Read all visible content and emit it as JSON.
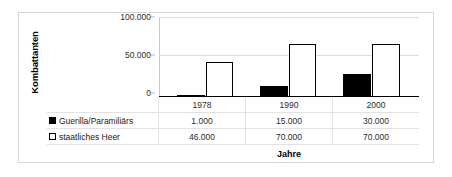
{
  "chart_data": {
    "type": "bar",
    "title": "",
    "xlabel": "Jahre",
    "ylabel": "Kombattanten",
    "categories": [
      "1978",
      "1990",
      "2000"
    ],
    "series": [
      {
        "name": "Guerilla/Paramiliärs",
        "marker": "filled-square",
        "values": [
          1000,
          15000,
          30000
        ],
        "value_labels": [
          "1.000",
          "15.000",
          "30.000"
        ]
      },
      {
        "name": "staatliches Heer",
        "marker": "hollow-square",
        "values": [
          46000,
          70000,
          70000
        ],
        "value_labels": [
          "46.000",
          "70.000",
          "70.000"
        ]
      }
    ],
    "ylim": [
      0,
      100000
    ],
    "yticks": [
      0,
      50000,
      100000
    ],
    "ytick_labels": [
      "0",
      "50.000",
      "100.000"
    ],
    "grid": true,
    "legend_position": "bottom-left-table",
    "colors": {
      "series_guerilla": "#000000",
      "series_heer": "#ffffff",
      "outline": "#000000",
      "gridline": "#dcdcdc",
      "frame": "#d6d6d6",
      "table_rule": "#e2e2e2",
      "text": "#2b2b2b"
    }
  }
}
